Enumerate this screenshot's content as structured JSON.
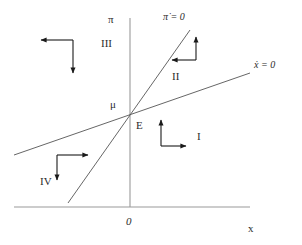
{
  "figure": {
    "type": "phase-diagram",
    "background_color": "#ffffff",
    "axis_color": "#9a9a9a",
    "curve_color": "#555555",
    "arrow_color": "#1a1a1a",
    "text_color": "#2b2b2b"
  },
  "axes": {
    "vertical": {
      "label": "π",
      "x_px": 130,
      "y_top_px": 18,
      "y_bottom_px": 207
    },
    "horizontal": {
      "label": "x",
      "y_px": 207,
      "x_left_px": 14,
      "x_right_px": 250
    },
    "origin_label": "0"
  },
  "nullclines": [
    {
      "name": "pi-dot-zero",
      "label": "π̇ = 0",
      "description": "steep upward sloping locus",
      "x1_px": 68,
      "y1_px": 203,
      "x2_px": 190,
      "y2_px": 30
    },
    {
      "name": "x-dot-zero",
      "label": "ẋ = 0",
      "description": "shallow upward sloping locus",
      "x1_px": 14,
      "y1_px": 155,
      "x2_px": 250,
      "y2_px": 73
    }
  ],
  "points": [
    {
      "name": "equilibrium",
      "label": "E",
      "x_px": 130,
      "y_px": 114
    },
    {
      "name": "mu-intercept",
      "label": "μ",
      "x_px": 130,
      "y_px": 104
    }
  ],
  "regions": [
    {
      "id": "I",
      "label": "I",
      "label_x_px": 199,
      "label_y_px": 136,
      "arrows": [
        "up",
        "right"
      ]
    },
    {
      "id": "II",
      "label": "II",
      "label_x_px": 176,
      "label_y_px": 76,
      "arrows": [
        "up",
        "left"
      ]
    },
    {
      "id": "III",
      "label": "III",
      "label_x_px": 106,
      "label_y_px": 43,
      "arrows": [
        "left",
        "down"
      ]
    },
    {
      "id": "IV",
      "label": "IV",
      "label_x_px": 44,
      "label_y_px": 181,
      "arrows": [
        "right",
        "down"
      ]
    }
  ],
  "arrow_markers": [
    {
      "region": "III",
      "direction": "left",
      "from_x": 73,
      "from_y": 40,
      "to_x": 39,
      "to_y": 40
    },
    {
      "region": "III",
      "direction": "down",
      "from_x": 73,
      "from_y": 40,
      "to_x": 73,
      "to_y": 75
    },
    {
      "region": "II",
      "direction": "left",
      "from_x": 196,
      "from_y": 60,
      "to_x": 170,
      "to_y": 60
    },
    {
      "region": "II",
      "direction": "up",
      "from_x": 196,
      "from_y": 60,
      "to_x": 196,
      "to_y": 35
    },
    {
      "region": "I",
      "direction": "right",
      "from_x": 161,
      "from_y": 146,
      "to_x": 188,
      "to_y": 146
    },
    {
      "region": "I",
      "direction": "up",
      "from_x": 161,
      "from_y": 146,
      "to_x": 161,
      "to_y": 118
    },
    {
      "region": "IV",
      "direction": "right",
      "from_x": 57,
      "from_y": 155,
      "to_x": 90,
      "to_y": 155
    },
    {
      "region": "IV",
      "direction": "down",
      "from_x": 57,
      "from_y": 155,
      "to_x": 57,
      "to_y": 182
    }
  ],
  "labels": {
    "pi_axis": "π",
    "x_axis": "x",
    "origin": "0",
    "pi_dot_nullcline": "π̇ = 0",
    "x_dot_nullcline": "ẋ = 0",
    "mu": "μ",
    "equilibrium": "E",
    "region_1": "I",
    "region_2": "II",
    "region_3": "III",
    "region_4": "IV"
  }
}
